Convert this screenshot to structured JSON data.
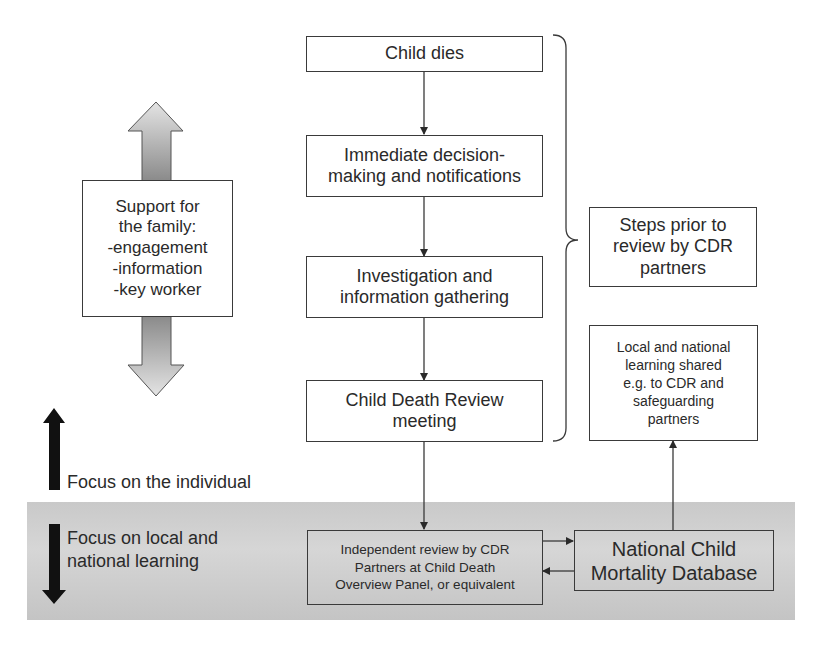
{
  "flow_steps": [
    {
      "id": "child-dies",
      "lines": [
        "Child dies"
      ]
    },
    {
      "id": "immediate-decision",
      "lines": [
        "Immediate decision-",
        "making and notifications"
      ]
    },
    {
      "id": "investigation",
      "lines": [
        "Investigation and",
        "information gathering"
      ]
    },
    {
      "id": "cdr-meeting",
      "lines": [
        "Child Death Review",
        "meeting"
      ]
    }
  ],
  "support_box": {
    "lines": [
      "Support for",
      "the family:",
      "-engagement",
      "-information",
      "-key worker"
    ]
  },
  "steps_prior_box": {
    "lines": [
      "Steps prior to",
      "review by CDR",
      "partners"
    ]
  },
  "learning_shared_box": {
    "lines": [
      "Local and national",
      "learning shared",
      "e.g. to CDR and",
      "safeguarding",
      "partners"
    ]
  },
  "independent_review_box": {
    "lines": [
      "Independent review by CDR",
      "Partners at Child Death",
      "Overview Panel, or equivalent"
    ]
  },
  "database_box": {
    "lines": [
      "National Child",
      "Mortality Database"
    ]
  },
  "focus_individual": {
    "label": "Focus on the individual"
  },
  "focus_learning": {
    "lines": [
      "Focus on local and",
      "national learning"
    ]
  },
  "colors": {
    "line": "#3a3a3a",
    "band": "#cccccc",
    "arrow_fill_light": "#d8d8d8",
    "arrow_fill_dark": "#8e8e8e",
    "focus_arrow": "#111111"
  }
}
